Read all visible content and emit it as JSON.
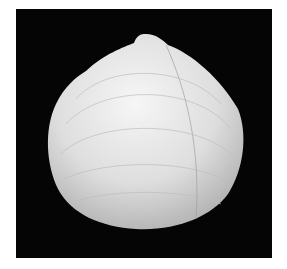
{
  "image": {
    "subject": "bivalve seashell",
    "description": "White clam shell photographed on a black background",
    "background_color": "#050505",
    "page_color": "#ffffff",
    "shell_color": "#e8e8e8"
  }
}
